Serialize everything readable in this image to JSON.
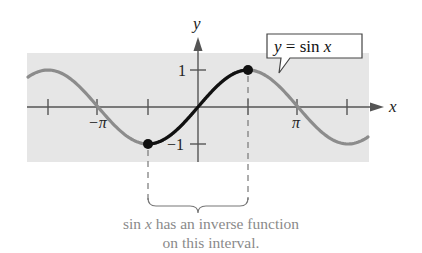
{
  "figure": {
    "axis_labels": {
      "x": "x",
      "y": "y"
    },
    "tick_labels": {
      "neg_pi": "−π",
      "pi": "π",
      "y_one": "1",
      "y_neg_one": "−1"
    },
    "callout": {
      "y": "y",
      "eq": " = sin ",
      "x": "x"
    },
    "caption": {
      "line1_italic_prefix_a": "sin ",
      "line1_italic_x": "x",
      "line1_rest": " has an inverse function",
      "line2": "on this interval."
    },
    "colors": {
      "background_band": "#e6e6e6",
      "curve_gray": "#8c8c8c",
      "curve_highlight": "#111111",
      "axis": "#555555",
      "caption": "#8a8a8a"
    }
  },
  "chart_data": {
    "type": "line",
    "title": "",
    "xlabel": "x",
    "ylabel": "y",
    "function": "y = sin x",
    "x_ticks": [
      "-3π/2",
      "-π",
      "-π/2",
      "π/2",
      "π",
      "3π/2"
    ],
    "x_tick_labels_shown": [
      "−π",
      "π"
    ],
    "y_ticks": [
      1,
      -1
    ],
    "xlim": [
      -5.0,
      5.4
    ],
    "ylim": [
      -1.1,
      1.1
    ],
    "series": [
      {
        "name": "sin x (full)",
        "style": "gray",
        "x_range": [
          "-5.0",
          "5.4"
        ]
      },
      {
        "name": "sin x restricted",
        "style": "black bold",
        "x_range": [
          "-π/2",
          "π/2"
        ]
      }
    ],
    "points": [
      {
        "x": "-π/2",
        "y": -1,
        "marker": "filled-dot"
      },
      {
        "x": "π/2",
        "y": 1,
        "marker": "filled-dot"
      }
    ],
    "annotations": [
      "y = sin x",
      "sin x has an inverse function on this interval."
    ],
    "grid": false
  }
}
